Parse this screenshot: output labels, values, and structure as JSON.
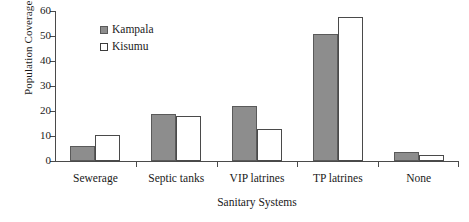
{
  "chart_data": {
    "type": "bar",
    "title": "",
    "xlabel": "Sanitary Systems",
    "ylabel": "Population Coverage (%)",
    "categories": [
      "Sewerage",
      "Septic tanks",
      "VIP latrines",
      "TP latrines",
      "None"
    ],
    "series": [
      {
        "name": "Kampala",
        "color": "#8d8d8d",
        "values": [
          6,
          19,
          22,
          51,
          3.5
        ]
      },
      {
        "name": "Kisumu",
        "color": "#ffffff",
        "values": [
          10.5,
          18,
          13,
          57.5,
          2.5
        ]
      }
    ],
    "ylim": [
      0,
      60
    ],
    "yticks": [
      0,
      10,
      20,
      30,
      40,
      50,
      60
    ],
    "ytick_labels": [
      "0",
      "10",
      "20",
      "30",
      "40",
      "50",
      "60"
    ],
    "grid": false,
    "legend_position": "upper-left-inside"
  },
  "legend": {
    "items": [
      {
        "label": "Kampala",
        "swatch": "filled-gray-square"
      },
      {
        "label": "Kisumu",
        "swatch": "open-white-square"
      }
    ]
  }
}
